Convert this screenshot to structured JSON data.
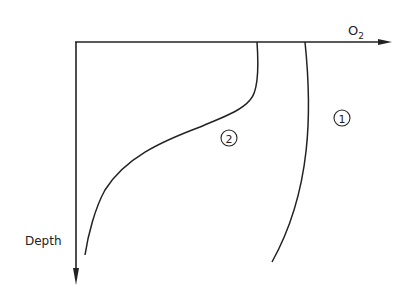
{
  "diagram": {
    "x_axis_label": "O",
    "x_axis_subscript": "2",
    "y_axis_label": "Depth",
    "curves": [
      {
        "id": "1",
        "label": "1"
      },
      {
        "id": "2",
        "label": "2"
      }
    ],
    "line_color": "#222222",
    "background": "#ffffff"
  }
}
